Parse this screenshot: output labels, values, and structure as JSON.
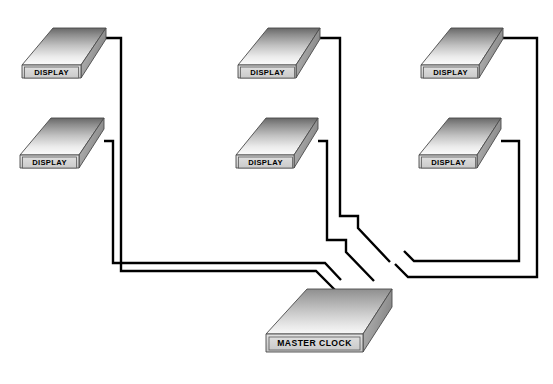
{
  "diagram": {
    "type": "block-diagram",
    "background_color": "#ffffff",
    "cable_color": "#000000",
    "cable_width": 2.4,
    "box_outline_color": "#3a3a3a",
    "label_panel_fill": "#d8d8d8",
    "top_face_gradient": [
      "#6e6e6e",
      "#f7f7f7"
    ],
    "side_face_gradient": [
      "#b4b4b4",
      "#8a8a8a"
    ],
    "front_face_fill": "#cfcfcf"
  },
  "master_clock": {
    "label": "MASTER CLOCK",
    "cable_count": 6
  },
  "displays": [
    {
      "id": "display-1",
      "label": "DISPLAY",
      "row": 1,
      "column": 1
    },
    {
      "id": "display-2",
      "label": "DISPLAY",
      "row": 1,
      "column": 2
    },
    {
      "id": "display-3",
      "label": "DISPLAY",
      "row": 1,
      "column": 3
    },
    {
      "id": "display-4",
      "label": "DISPLAY",
      "row": 2,
      "column": 1
    },
    {
      "id": "display-5",
      "label": "DISPLAY",
      "row": 2,
      "column": 2
    },
    {
      "id": "display-6",
      "label": "DISPLAY",
      "row": 2,
      "column": 3
    }
  ],
  "connections": [
    {
      "from": "display-1",
      "to": "master_clock"
    },
    {
      "from": "display-2",
      "to": "master_clock"
    },
    {
      "from": "display-3",
      "to": "master_clock"
    },
    {
      "from": "display-4",
      "to": "master_clock"
    },
    {
      "from": "display-5",
      "to": "master_clock"
    },
    {
      "from": "display-6",
      "to": "master_clock"
    }
  ]
}
